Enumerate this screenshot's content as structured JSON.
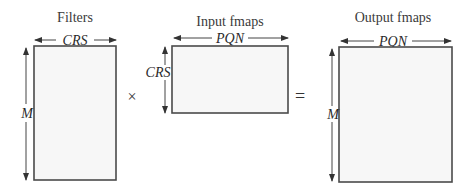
{
  "diagram": {
    "filters": {
      "title": "Filters",
      "width_label": "CRS",
      "height_label": "M"
    },
    "operator_multiply": "×",
    "input": {
      "title": "Input fmaps",
      "width_label": "PQN",
      "height_label": "CRS"
    },
    "operator_equals": "=",
    "output": {
      "title": "Output fmaps",
      "width_label": "PQN",
      "height_label": "M"
    }
  }
}
